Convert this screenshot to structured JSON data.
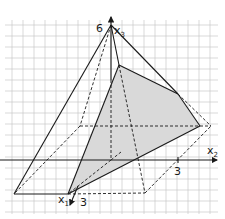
{
  "diagram": {
    "title": "",
    "type": "3d-coordinate-pyramid-with-cross-section",
    "colors": {
      "grid": "#c8c8c8",
      "lines": "#1a1a1a",
      "shaded_section": "#d9d9d9"
    },
    "axes": {
      "x1": {
        "label": "x",
        "subscript": "1",
        "tick_label": "3"
      },
      "x2": {
        "label": "x",
        "subscript": "2",
        "tick_label": "3"
      },
      "x3": {
        "label": "x",
        "subscript": "3",
        "tick_label": "6"
      }
    }
  }
}
